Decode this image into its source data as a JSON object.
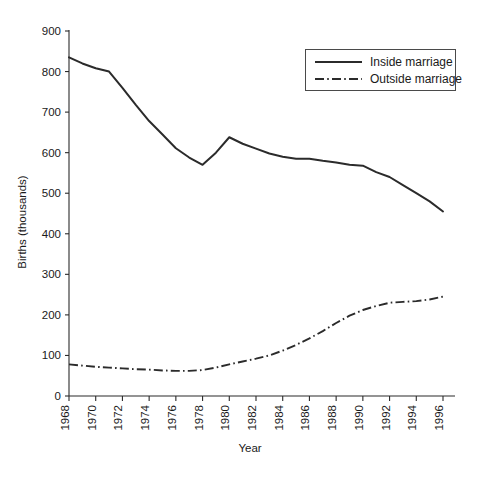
{
  "chart_data": {
    "type": "line",
    "title": "",
    "xlabel": "Year",
    "ylabel": "Births (thousands)",
    "xlim": [
      1968,
      1996
    ],
    "ylim": [
      0,
      900
    ],
    "grid": false,
    "legend_position": "top-right",
    "xticks": [
      1968,
      1970,
      1972,
      1974,
      1976,
      1978,
      1980,
      1982,
      1984,
      1986,
      1988,
      1990,
      1992,
      1994,
      1996
    ],
    "xtick_labels": [
      "1968",
      "1970",
      "1972",
      "1974",
      "1976",
      "1978",
      "1980",
      "1982",
      "1984",
      "1986",
      "1988",
      "1990",
      "1992",
      "1994",
      "1996"
    ],
    "yticks": [
      0,
      100,
      200,
      300,
      400,
      500,
      600,
      700,
      800,
      900
    ],
    "ytick_labels": [
      "0",
      "100",
      "200",
      "300",
      "400",
      "500",
      "600",
      "700",
      "800",
      "900"
    ],
    "x": [
      1968,
      1969,
      1970,
      1971,
      1972,
      1973,
      1974,
      1975,
      1976,
      1977,
      1978,
      1979,
      1980,
      1981,
      1982,
      1983,
      1984,
      1985,
      1986,
      1987,
      1988,
      1989,
      1990,
      1991,
      1992,
      1993,
      1994,
      1995,
      1996
    ],
    "series": [
      {
        "name": "Inside marriage",
        "style": "solid",
        "color": "#2b2b2b",
        "values": [
          835,
          820,
          808,
          800,
          760,
          718,
          678,
          645,
          611,
          588,
          570,
          600,
          638,
          622,
          610,
          598,
          590,
          585,
          585,
          580,
          576,
          570,
          568,
          552,
          540,
          520,
          500,
          480,
          455
        ]
      },
      {
        "name": "Outside marriage",
        "style": "dash-dot",
        "color": "#2b2b2b",
        "values": [
          78,
          75,
          72,
          70,
          68,
          66,
          65,
          63,
          62,
          62,
          64,
          70,
          78,
          85,
          92,
          100,
          112,
          126,
          142,
          160,
          180,
          198,
          212,
          222,
          230,
          232,
          234,
          238,
          245
        ]
      }
    ]
  },
  "legend": {
    "entries": [
      {
        "label": "Inside marriage",
        "style": "solid"
      },
      {
        "label": "Outside marriage",
        "style": "dash-dot"
      }
    ]
  },
  "axes": {
    "x_title": "Year",
    "y_title": "Births (thousands)"
  }
}
